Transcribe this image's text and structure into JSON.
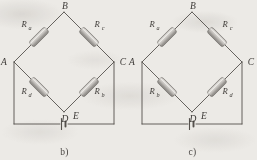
{
  "figure": {
    "panels": [
      {
        "caption": "b)",
        "nodes": [
          {
            "id": "A",
            "label": "A",
            "x": 14,
            "y": 62
          },
          {
            "id": "B",
            "label": "B",
            "x": 64,
            "y": 12
          },
          {
            "id": "C",
            "label": "C",
            "x": 114,
            "y": 62
          },
          {
            "id": "D",
            "label": "D",
            "x": 64,
            "y": 112
          }
        ],
        "resistors": [
          {
            "name": "R_a",
            "letter": "R",
            "sub": "a",
            "from": "A",
            "to": "B",
            "position": "upper-left"
          },
          {
            "name": "R_c",
            "letter": "R",
            "sub": "c",
            "from": "B",
            "to": "C",
            "position": "upper-right"
          },
          {
            "name": "R_d",
            "letter": "R",
            "sub": "d",
            "from": "A",
            "to": "D",
            "position": "lower-left"
          },
          {
            "name": "R_b",
            "letter": "R",
            "sub": "b",
            "from": "D",
            "to": "C",
            "position": "lower-right"
          }
        ],
        "source": {
          "label": "E",
          "type": "battery-emf",
          "on_wire": "A-to-C bottom"
        }
      },
      {
        "caption": "c)",
        "nodes": [
          {
            "id": "A",
            "label": "A",
            "x": 14,
            "y": 62
          },
          {
            "id": "B",
            "label": "B",
            "x": 64,
            "y": 12
          },
          {
            "id": "C",
            "label": "C",
            "x": 114,
            "y": 62
          },
          {
            "id": "D",
            "label": "D",
            "x": 64,
            "y": 112
          }
        ],
        "resistors": [
          {
            "name": "R_a",
            "letter": "R",
            "sub": "a",
            "from": "A",
            "to": "B",
            "position": "upper-left"
          },
          {
            "name": "R_c",
            "letter": "R",
            "sub": "c",
            "from": "B",
            "to": "C",
            "position": "upper-right"
          },
          {
            "name": "R_b",
            "letter": "R",
            "sub": "b",
            "from": "A",
            "to": "D",
            "position": "lower-left"
          },
          {
            "name": "R_d",
            "letter": "R",
            "sub": "d",
            "from": "D",
            "to": "C",
            "position": "lower-right"
          }
        ],
        "source": {
          "label": "E",
          "type": "battery-emf",
          "on_wire": "A-to-C bottom"
        }
      }
    ],
    "colors": {
      "background": "#eceae6",
      "wire": "#55514d",
      "text": "#3d3a37",
      "resistor_body_light": "#d8d6d2",
      "resistor_body_dark": "#8e8b87",
      "resistor_outline": "#6e6a66"
    }
  }
}
